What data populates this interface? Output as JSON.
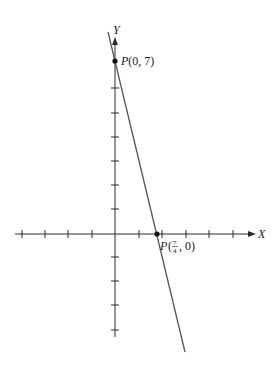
{
  "figure": {
    "type": "coordinate-plot",
    "axes": {
      "x_label": "X",
      "y_label": "Y",
      "x_ticks_units": [
        -4,
        -3,
        -2,
        -1,
        1,
        2,
        3,
        4,
        5
      ],
      "y_ticks_units": [
        -4,
        -3,
        -2,
        -1,
        1,
        2,
        3,
        4,
        5,
        6,
        7
      ]
    },
    "line": {
      "description": "straight line through P(0,7) and P(7/4,0)",
      "slope": -4,
      "y_intercept": 7,
      "color": "#555555"
    },
    "points": [
      {
        "name": "P",
        "x": 0,
        "y": 7,
        "label_prefix": "P",
        "label_coords": "(0, 7)"
      },
      {
        "name": "P",
        "x": 1.75,
        "y": 0,
        "label_prefix": "P",
        "label_num": "7",
        "label_den": "4",
        "label_rest": ", 0)"
      }
    ],
    "colors": {
      "axis": "#2a2a2a",
      "line": "#555555",
      "point": "#111111"
    }
  }
}
